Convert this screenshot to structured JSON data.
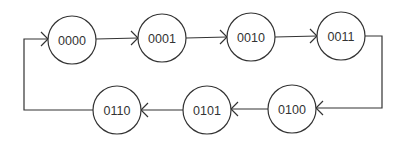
{
  "diagram": {
    "type": "state-transition",
    "colors": {
      "stroke": "#333333",
      "background": "#ffffff",
      "text": "#333333"
    },
    "states": [
      {
        "id": "s0",
        "label": "0000",
        "cx": 72,
        "cy": 40,
        "r": 24
      },
      {
        "id": "s1",
        "label": "0001",
        "cx": 162,
        "cy": 38,
        "r": 24
      },
      {
        "id": "s2",
        "label": "0010",
        "cx": 251,
        "cy": 37,
        "r": 24
      },
      {
        "id": "s3",
        "label": "0011",
        "cx": 341,
        "cy": 36,
        "r": 24
      },
      {
        "id": "s4",
        "label": "0100",
        "cx": 292,
        "cy": 109,
        "r": 24
      },
      {
        "id": "s5",
        "label": "0101",
        "cx": 207,
        "cy": 110,
        "r": 24
      },
      {
        "id": "s6",
        "label": "0110",
        "cx": 117,
        "cy": 110,
        "r": 24
      }
    ],
    "transitions": [
      {
        "from": "0000",
        "to": "0001"
      },
      {
        "from": "0001",
        "to": "0010"
      },
      {
        "from": "0010",
        "to": "0011"
      },
      {
        "from": "0011",
        "to": "0100"
      },
      {
        "from": "0100",
        "to": "0101"
      },
      {
        "from": "0101",
        "to": "0110"
      },
      {
        "from": "0110",
        "to": "0000"
      }
    ]
  }
}
